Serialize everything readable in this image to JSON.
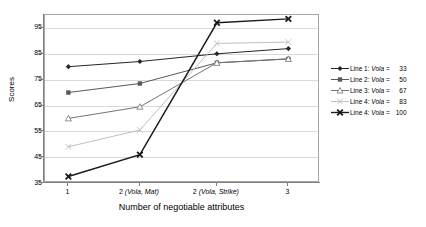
{
  "chart_data": {
    "type": "line",
    "title": "",
    "xlabel": "Number of negotiable attributes",
    "ylabel": "Scores",
    "categories": [
      "1",
      "2 (Vola, Mat)",
      "2 (Vola, Strike)",
      "3"
    ],
    "category_labels": [
      {
        "main": "1",
        "italic": ""
      },
      {
        "main": "2 ",
        "italic": "(Vola, Mat)"
      },
      {
        "main": "2 ",
        "italic": "(Vola, Strike)"
      },
      {
        "main": "3",
        "italic": ""
      }
    ],
    "ylim": [
      35,
      100
    ],
    "yticks": [
      35,
      45,
      55,
      65,
      75,
      85,
      95
    ],
    "grid": "horizontal",
    "legend_position": "right",
    "series": [
      {
        "name": "Line 1: Vola =  33",
        "label_prefix": "Line 1: ",
        "label_italic": "Vola",
        "label_eq": " = ",
        "value_text": "33",
        "marker": "diamond",
        "color": "#262626",
        "values": [
          80,
          82,
          85,
          87
        ]
      },
      {
        "name": "Line 2: Vola =  50",
        "label_prefix": "Line 2: ",
        "label_italic": "Vola",
        "label_eq": " = ",
        "value_text": "50",
        "marker": "square",
        "color": "#595959",
        "values": [
          70,
          73.5,
          81.5,
          83
        ]
      },
      {
        "name": "Line 3: Vola =  67",
        "label_prefix": "Line 3: ",
        "label_italic": "Vola",
        "label_eq": " = ",
        "value_text": "67",
        "marker": "triangle",
        "color": "#737373",
        "values": [
          60,
          64.5,
          81.5,
          83
        ]
      },
      {
        "name": "Line 4: Vola =  83",
        "label_prefix": "Line 4: ",
        "label_italic": "Vola",
        "label_eq": " = ",
        "value_text": "83",
        "marker": "cross",
        "color": "#bfbfbf",
        "values": [
          49,
          55.5,
          89,
          89.5
        ]
      },
      {
        "name": "Line 4: Vola = 100",
        "label_prefix": "Line 4: ",
        "label_italic": "Vola",
        "label_eq": " = ",
        "value_text": "100",
        "marker": "cross-bold",
        "color": "#1a1a1a",
        "values": [
          37.5,
          46,
          97,
          98.5
        ]
      }
    ]
  }
}
